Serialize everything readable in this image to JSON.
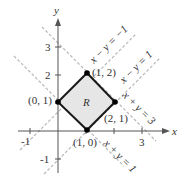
{
  "figure": {
    "region_label": "R",
    "axes": {
      "x_label": "x",
      "y_label": "y",
      "x_ticks": [
        "-1",
        "3"
      ],
      "y_ticks": [
        "3",
        "2",
        "-1"
      ]
    },
    "vertices": [
      {
        "label": "(1, 2)"
      },
      {
        "label": "(0, 1)"
      },
      {
        "label": "(2, 1)"
      },
      {
        "label": "(1, 0)"
      }
    ],
    "lines": [
      {
        "label": "x − y = −1"
      },
      {
        "label": "x − y = 1"
      },
      {
        "label": "x + y = 3"
      },
      {
        "label": "x + y = 1"
      }
    ],
    "colors": {
      "region_fill": "#e6e6e6",
      "boundary": "#1a1a1a",
      "dashed": "#b5b5b5",
      "axis": "#555555"
    }
  }
}
